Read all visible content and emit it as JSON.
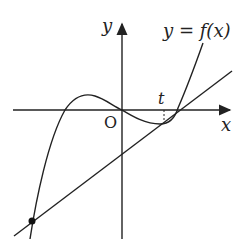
{
  "labels": {
    "y_axis": "y",
    "x_axis": "x",
    "origin": "O",
    "curve": "y = f(x)",
    "tangent_point": "t"
  },
  "colors": {
    "ink": "#222222",
    "background": "#ffffff"
  }
}
